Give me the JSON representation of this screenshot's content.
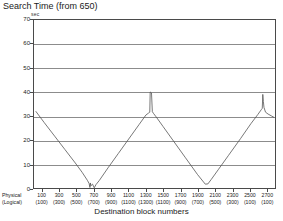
{
  "chart_data": {
    "type": "line",
    "title": "Search Time (from 650)",
    "ylabel": "sec",
    "xlabel": "Destination block numbers",
    "ylim": [
      0,
      70
    ],
    "yticks": [
      0,
      10,
      20,
      30,
      40,
      50,
      60,
      70
    ],
    "grid": true,
    "legend": null,
    "xlim": [
      0,
      2800
    ],
    "x_axis_rows": [
      {
        "header": "Physical",
        "ticks": [
          "100",
          "300",
          "500",
          "700",
          "900",
          "1100",
          "1300",
          "1500",
          "1700",
          "1900",
          "2100",
          "2300",
          "2500",
          "2700"
        ]
      },
      {
        "header": "(Logical)",
        "ticks": [
          "(100)",
          "(300)",
          "(500)",
          "(700)",
          "(900)",
          "(1100)",
          "(1300)",
          "(1100)",
          "(900)",
          "(700)",
          "(500)",
          "(300)",
          "(100)",
          "(100)"
        ]
      }
    ],
    "series": [
      {
        "name": "search time",
        "x": [
          20,
          120,
          240,
          360,
          480,
          560,
          620,
          640,
          650,
          655,
          660,
          680,
          700,
          720,
          760,
          860,
          980,
          1100,
          1220,
          1300,
          1330,
          1345,
          1350,
          1358,
          1365,
          1375,
          1390,
          1420,
          1500,
          1620,
          1760,
          1900,
          1990,
          2020,
          2060,
          2140,
          2260,
          2400,
          2520,
          2600,
          2640,
          2652,
          2658,
          2665,
          2672,
          2690,
          2720,
          2760,
          2790
        ],
        "y": [
          32.0,
          27.2,
          21.6,
          16.0,
          10.4,
          6.5,
          3.2,
          1.9,
          0.2,
          2.1,
          0.9,
          1.6,
          0.1,
          1.4,
          3.2,
          8.4,
          14.4,
          20.4,
          26.4,
          30.4,
          31.2,
          31.6,
          40.0,
          39.8,
          39.6,
          31.8,
          31.0,
          29.6,
          25.6,
          19.6,
          12.6,
          5.6,
          1.6,
          1.7,
          3.6,
          7.6,
          13.6,
          20.6,
          26.8,
          30.6,
          32.6,
          33.2,
          39.0,
          36.0,
          33.6,
          31.6,
          30.8,
          30.0,
          29.4
        ]
      }
    ],
    "colors": {
      "line": "#555555",
      "grid": "#8c8c8c",
      "axis": "#4a4a4a",
      "background": "#ffffff"
    }
  }
}
